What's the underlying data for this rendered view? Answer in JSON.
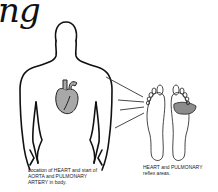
{
  "title_fragment": "ng",
  "captions": {
    "body": "Location of HEART and start of AORTA and PULMONARY ARTERY in body.",
    "feet": "HEART and PULMONARY reflex areas."
  },
  "colors": {
    "heart_fill": "#a8a8a8",
    "reflex_area_fill": "#8c8c8c",
    "line": "#111111"
  },
  "figures": {
    "body_icon": "human-torso-outline",
    "organ_icon": "heart",
    "feet_icon": "foot-soles",
    "connector": "reflex-lines"
  }
}
